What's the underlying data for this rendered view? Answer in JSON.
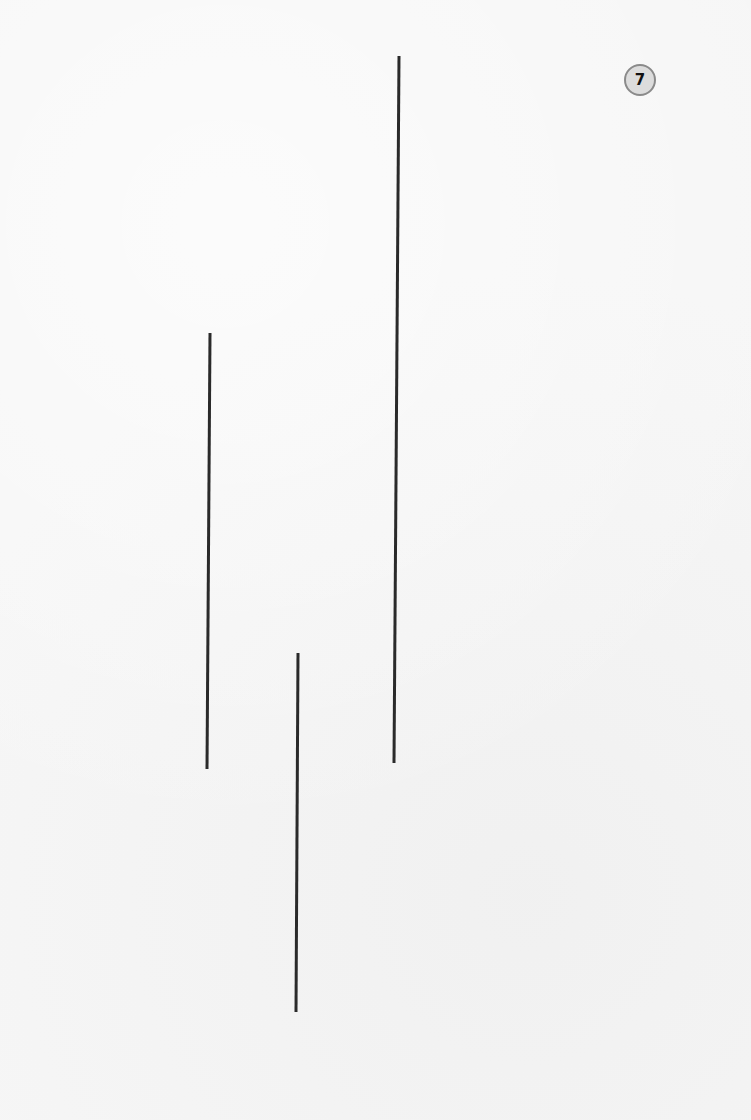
{
  "page": {
    "background": "#f6f6f6",
    "badge": {
      "number": "7",
      "fill": "#dcdcdc",
      "stroke": "#8a8a8a"
    }
  },
  "diagram": {
    "type": "line-length-comparison",
    "stroke_color": "#2a2a2a",
    "stroke_width": 3,
    "lines": [
      {
        "id": "line-a",
        "x1": 210,
        "y1": 333,
        "x2": 207,
        "y2": 769
      },
      {
        "id": "line-b",
        "x1": 298,
        "y1": 653,
        "x2": 296,
        "y2": 1012
      },
      {
        "id": "line-c",
        "x1": 399,
        "y1": 56,
        "x2": 394,
        "y2": 763
      }
    ]
  }
}
